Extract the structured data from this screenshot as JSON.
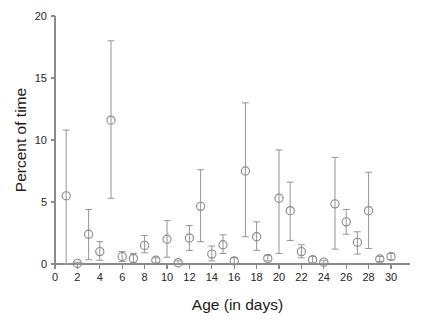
{
  "chart_data": {
    "type": "scatter",
    "title": "",
    "xlabel": "Age (in days)",
    "ylabel": "Percent of time",
    "xlim": [
      0,
      30.8
    ],
    "ylim": [
      0,
      20
    ],
    "grid": false,
    "legend": null,
    "marker_style": "open-circle",
    "error_bars": "vertical",
    "xticks": [
      0,
      2,
      4,
      6,
      8,
      10,
      12,
      14,
      16,
      18,
      20,
      22,
      24,
      26,
      28,
      30
    ],
    "xtick_labels": [
      "0",
      "2",
      "4",
      "6",
      "8",
      "10",
      "12",
      "14",
      "16",
      "18",
      "20",
      "22",
      "24",
      "26",
      "28",
      "30"
    ],
    "yticks": [
      0,
      5,
      10,
      15,
      20
    ],
    "ytick_labels": [
      "0",
      "5",
      "10",
      "15",
      "20"
    ],
    "x": [
      1,
      2,
      3,
      4,
      5,
      6,
      7,
      8,
      9,
      10,
      11,
      12,
      13,
      14,
      15,
      16,
      17,
      18,
      19,
      20,
      21,
      22,
      23,
      24,
      25,
      26,
      27,
      28,
      29,
      30
    ],
    "values": [
      5.5,
      0.05,
      2.4,
      1.0,
      11.6,
      0.6,
      0.45,
      1.5,
      0.3,
      2.0,
      0.1,
      2.1,
      4.65,
      0.8,
      1.55,
      0.25,
      7.5,
      2.2,
      0.45,
      5.3,
      4.3,
      1.0,
      0.35,
      0.15,
      4.85,
      3.4,
      1.75,
      4.3,
      0.4,
      0.6
    ],
    "err_low": [
      0.0,
      0.0,
      0.35,
      0.3,
      5.3,
      0.2,
      0.1,
      0.9,
      0.1,
      0.55,
      0.0,
      1.1,
      1.8,
      0.25,
      0.85,
      0.05,
      2.2,
      1.1,
      0.25,
      0.85,
      1.9,
      0.5,
      0.1,
      0.05,
      1.2,
      2.4,
      0.8,
      1.25,
      0.2,
      0.35
    ],
    "err_high": [
      10.8,
      0.15,
      4.4,
      1.8,
      18.0,
      1.0,
      0.85,
      2.3,
      0.5,
      3.5,
      0.25,
      3.1,
      7.6,
      1.45,
      2.35,
      0.5,
      13.0,
      3.4,
      0.7,
      9.2,
      6.6,
      1.55,
      0.6,
      0.3,
      8.6,
      4.4,
      2.6,
      7.4,
      0.6,
      0.85
    ]
  }
}
